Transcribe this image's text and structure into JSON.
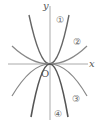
{
  "diagram": {
    "axes": {
      "x_label": "x",
      "y_label": "y",
      "origin_label": "O"
    },
    "curves": [
      {
        "id": "1",
        "label": "①",
        "shape": "steep upward parabola"
      },
      {
        "id": "2",
        "label": "②",
        "shape": "wide upward parabola"
      },
      {
        "id": "3",
        "label": "③",
        "shape": "wide downward parabola"
      },
      {
        "id": "4",
        "label": "④",
        "shape": "steep downward parabola"
      }
    ],
    "colors": {
      "curve_dark": "#555555",
      "curve_light": "#999999",
      "axis": "#aaaaaa"
    }
  }
}
